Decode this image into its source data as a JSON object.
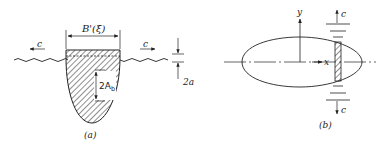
{
  "panel_a": {
    "caption": "(a)",
    "beam_label": "B'(ξ)",
    "wave_speed_left": "c",
    "wave_speed_right": "c",
    "amplitude_label": "2a",
    "body_motion_label": "2A",
    "body_motion_subscript": "b"
  },
  "panel_b": {
    "caption": "(b)",
    "x_axis_label": "x",
    "y_axis_label": "y",
    "wave_speed_top": "c",
    "wave_speed_bottom": "c"
  },
  "colors": {
    "ink": "#222222",
    "background": "#ffffff"
  }
}
